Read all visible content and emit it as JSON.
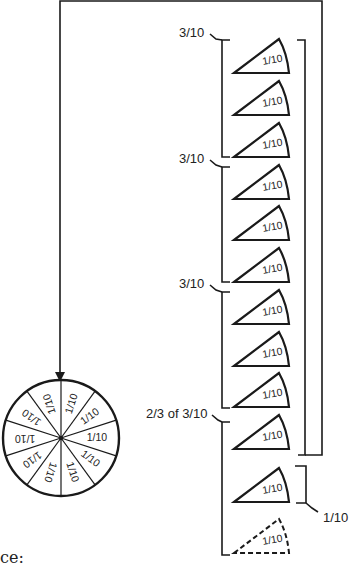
{
  "diagram": {
    "pie": {
      "slices": 10,
      "slice_label": "1/10",
      "labels": [
        "1/10",
        "1/10",
        "1/10",
        "1/10",
        "1/10",
        "1/10",
        "1/10",
        "1/10",
        "1/10",
        "1/10"
      ]
    },
    "wedges": [
      {
        "label": "1/10",
        "style": "solid"
      },
      {
        "label": "1/10",
        "style": "solid"
      },
      {
        "label": "1/10",
        "style": "solid"
      },
      {
        "label": "1/10",
        "style": "solid"
      },
      {
        "label": "1/10",
        "style": "solid"
      },
      {
        "label": "1/10",
        "style": "solid"
      },
      {
        "label": "1/10",
        "style": "solid"
      },
      {
        "label": "1/10",
        "style": "solid"
      },
      {
        "label": "1/10",
        "style": "solid"
      },
      {
        "label": "1/10",
        "style": "solid"
      },
      {
        "label": "1/10",
        "style": "solid"
      },
      {
        "label": "1/10",
        "style": "dashed"
      }
    ],
    "brackets": [
      {
        "label": "3/10"
      },
      {
        "label": "3/10"
      },
      {
        "label": "3/10"
      },
      {
        "label": "2/3 of 3/10"
      },
      {
        "label": "1/10"
      }
    ],
    "footer_fragment": "ce:"
  }
}
